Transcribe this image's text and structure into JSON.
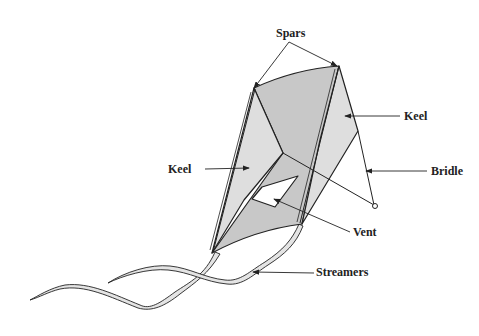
{
  "diagram": {
    "labels": {
      "spars": "Spars",
      "keel_right": "Keel",
      "keel_left": "Keel",
      "bridle": "Bridle",
      "vent": "Vent",
      "streamers": "Streamers"
    },
    "colors": {
      "sail_dark": "#c8c8c8",
      "sail_light": "#dedede",
      "outline": "#222222",
      "background": "#ffffff"
    }
  }
}
